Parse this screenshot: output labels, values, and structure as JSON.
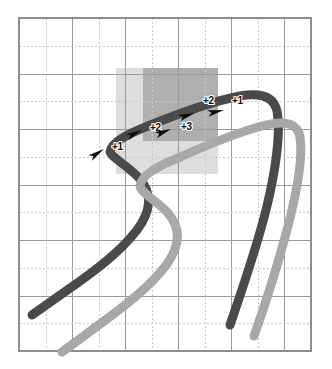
{
  "figure": {
    "canvas": {
      "width": 332,
      "height": 369,
      "background": "#ffffff"
    },
    "grid": {
      "x0": 19,
      "y0": 18,
      "x1": 311,
      "y1": 351,
      "columns": 11,
      "rows": 12,
      "minor_color": "#c9c9c9",
      "major_color": "#9a9a9a",
      "border_color": "#8d8d8d"
    },
    "regions": [
      {
        "name": "outer-shaded-region",
        "x": 116,
        "y": 68,
        "width": 102,
        "height": 106,
        "color": "#c8c8c8"
      },
      {
        "name": "inner-shaded-region",
        "x": 143,
        "y": 68,
        "width": 75,
        "height": 73,
        "color": "#9c9c9c"
      }
    ],
    "tracks": [
      {
        "name": "dark-trajectory",
        "color": "#4a4a4a",
        "width": 9,
        "path": "M 32,315 L 66,291 C 95,271 120,252 137,230 C 152,210 152,192 139,178 C 127,165 112,158 110,152 C 111,143 125,135 148,126 C 180,113 214,101 240,96 C 262,92 274,97 277,111 C 281,131 276,170 266,210 C 256,250 242,290 230,325"
      },
      {
        "name": "light-trajectory",
        "color": "#a8a8a8",
        "width": 9,
        "path": "M 62,352 L 96,327 C 126,305 151,286 167,264 C 181,244 180,227 168,213 C 156,200 141,193 140,186 C 141,176 155,167 178,158 C 209,144 242,131 266,125 C 286,120 298,124 300,137 C 303,156 297,192 287,230 C 277,268 265,305 254,336"
      }
    ],
    "markers": [
      {
        "name": "marker-plus-1-left",
        "label": "+1",
        "label_x": 112,
        "label_y": 150,
        "arrow_x": 104,
        "arrow_y": 149,
        "arrow_angle": -33
      },
      {
        "name": "marker-plus-2-left",
        "label": "+2",
        "label_x": 150,
        "label_y": 131,
        "arrow_x": 142,
        "arrow_y": 130,
        "arrow_angle": -26
      },
      {
        "name": "marker-plus-3-center",
        "label": "+3",
        "label_x": 181,
        "label_y": 130,
        "arrow_x": 171,
        "arrow_y": 129,
        "arrow_angle": -22
      },
      {
        "name": "marker-plus-2-right",
        "label": "+2",
        "label_x": 203,
        "label_y": 104,
        "arrow_x": 195,
        "arrow_y": 113,
        "arrow_angle": -18
      },
      {
        "name": "marker-plus-1-right",
        "label": "+1",
        "label_x": 232,
        "label_y": 104,
        "arrow_x": 224,
        "arrow_y": 110,
        "arrow_angle": -12
      }
    ]
  }
}
